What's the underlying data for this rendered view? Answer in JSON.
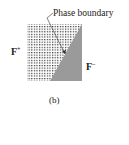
{
  "figure": {
    "panel_label": "(b)",
    "annotation": "Phase boundary",
    "region_left": {
      "symbol": "F",
      "superscript": "+"
    },
    "region_right": {
      "symbol": "F",
      "superscript": "−"
    },
    "colors": {
      "dots": "#333333",
      "shaded": "#9a9a9a",
      "border": "#555555"
    }
  }
}
